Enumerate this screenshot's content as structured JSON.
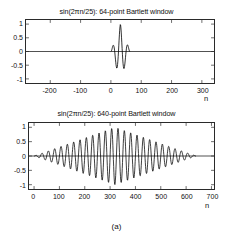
{
  "figure": {
    "caption": "(a)"
  },
  "charts": [
    {
      "id": "chart-64-point",
      "title": "sin(2πn/25):  64-point Bartlett window",
      "xlabel": "n",
      "ylabel": "",
      "xticks": [
        "-200",
        "-100",
        "0",
        "100",
        "200",
        "300"
      ],
      "xtick_values": [
        -200,
        -100,
        0,
        100,
        200,
        300
      ],
      "yticks": [
        "1",
        "0.5",
        "0",
        "-0.5",
        "-1"
      ],
      "ytick_values": [
        1,
        0.5,
        0,
        -0.5,
        -1
      ]
    },
    {
      "id": "chart-640-point",
      "title": "sin(2πn/25):  640-point Bartlett window",
      "xlabel": "n",
      "ylabel": "",
      "xticks": [
        "0",
        "100",
        "200",
        "300",
        "400",
        "500",
        "600",
        "700"
      ],
      "xtick_values": [
        0,
        100,
        200,
        300,
        400,
        500,
        600,
        700
      ],
      "yticks": [
        "1",
        "0.5",
        "0",
        "-0.5",
        "-1"
      ],
      "ytick_values": [
        1,
        0.5,
        0,
        -0.5,
        -1
      ]
    }
  ],
  "chart_data": [
    {
      "type": "line",
      "id": "chart-64-point",
      "title": "sin(2πn/25):  64-point Bartlett window",
      "xlabel": "n",
      "ylabel": "",
      "xlim": [
        -280,
        340
      ],
      "ylim": [
        -1.15,
        1.15
      ],
      "grid": false,
      "legend": null,
      "line_color": "#000000",
      "series": [
        {
          "name": "sin(2πn/25) × bartlett(64)",
          "description": "Sinusoid of period 25 samples multiplied by a 64-point triangular (Bartlett) window spanning n = 0 to 63, zero elsewhere; envelope peaks at amplitude 1 near n = 32.",
          "signal_period": 25,
          "window_type": "bartlett",
          "window_length": 64,
          "window_start": 0,
          "window_end": 63,
          "peak_amplitude": 1.0
        }
      ]
    },
    {
      "type": "line",
      "id": "chart-640-point",
      "title": "sin(2πn/25):  640-point Bartlett window",
      "xlabel": "n",
      "ylabel": "",
      "xlim": [
        -20,
        710
      ],
      "ylim": [
        -1.15,
        1.15
      ],
      "grid": false,
      "legend": null,
      "line_color": "#000000",
      "series": [
        {
          "name": "sin(2πn/25) × bartlett(640)",
          "description": "Sinusoid of period 25 samples multiplied by a 640-point triangular (Bartlett) window spanning n = 0 to 639, zero elsewhere; envelope rises linearly to amplitude 1 near n = 320 then decays linearly to 0 at n = 640.",
          "signal_period": 25,
          "window_type": "bartlett",
          "window_length": 640,
          "window_start": 0,
          "window_end": 639,
          "peak_amplitude": 1.0
        }
      ]
    }
  ]
}
